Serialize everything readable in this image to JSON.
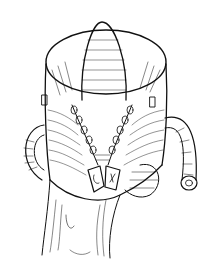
{
  "figure": {
    "kind": "surgical-illustration",
    "style": "black ink line drawing on white",
    "colors": {
      "ink": "#111111",
      "paper": "#ffffff"
    }
  }
}
